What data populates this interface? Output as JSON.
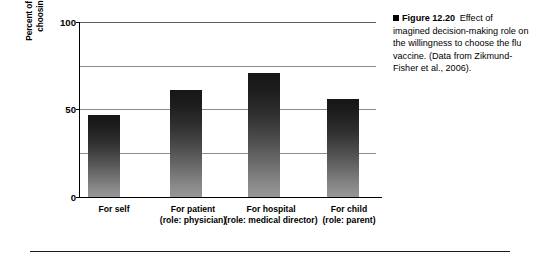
{
  "figure": {
    "caption_marker": "square-bullet",
    "caption_number": "Figure 12.20",
    "caption_text": "Effect of imagined decision-making role on the willingness to choose the flu vaccine. (Data from Zikmund-Fisher et al., 2006)."
  },
  "chart_data": {
    "type": "bar",
    "title": "",
    "xlabel": "",
    "ylabel": "Percent of particpants\nchoosing flu shot",
    "categories": [
      "For self",
      "For patient",
      "For hospital",
      "For child"
    ],
    "category_sublabels": [
      "",
      "(role: physician)",
      "(role: medical\ndirector)",
      "(role: parent)"
    ],
    "values": [
      47,
      61,
      71,
      56
    ],
    "ylim": [
      0,
      100
    ],
    "yticks": [
      0,
      50,
      100
    ],
    "ytick_labels": [
      "0",
      "50",
      "100"
    ],
    "gridlines": [
      0,
      25,
      50,
      75,
      100
    ],
    "grid": true,
    "legend": "none",
    "bar_fill": "gradient dark-to-gray",
    "bar_color_top": "#161616",
    "bar_color_bottom": "#969696",
    "grid_color": "#8d8d8d",
    "axis_color": "#000000",
    "background": "#ffffff"
  }
}
